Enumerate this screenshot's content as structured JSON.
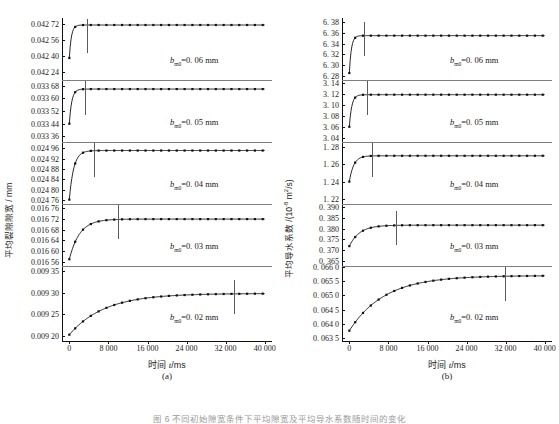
{
  "figure": {
    "caption": "图 6  不同初始隙宽条件下平均隙宽及平均导水系数随时间的变化"
  },
  "panels": [
    {
      "key": "a",
      "label": "(a)",
      "ytitle": "平均裂隙隙宽 / mm",
      "xtitle_cn": "时间 ",
      "xtitle_var": "t",
      "xtitle_unit": "/ms",
      "xticks": [
        "0",
        "8 000",
        "16 000",
        "24 000",
        "32 000",
        "40 000"
      ],
      "xvalues": [
        0,
        8000,
        16000,
        24000,
        32000,
        40000
      ],
      "xlim": [
        -1500,
        41500
      ],
      "subplots": [
        {
          "annotation_var": "b",
          "annotation_sub": "m0",
          "annotation_text": "=0. 06 mm",
          "yticks": [
            "0.042 72",
            "0.042 56",
            "0.042 40",
            "0.042 24"
          ],
          "yvalues": [
            0.04272,
            0.04256,
            0.0424,
            0.04224
          ],
          "ylim": [
            0.042155,
            0.042775
          ],
          "marker_time": 3600,
          "curve_start": 0.042375,
          "curve_end": 0.042705,
          "tau": 420
        },
        {
          "annotation_var": "b",
          "annotation_sub": "m0",
          "annotation_text": "=0. 05 mm",
          "yticks": [
            "0.033 68",
            "0.033 60",
            "0.033 52",
            "0.033 44",
            "0.033 36"
          ],
          "yvalues": [
            0.03368,
            0.0336,
            0.03352,
            0.03344,
            0.03336
          ],
          "ylim": [
            0.033325,
            0.033715
          ],
          "marker_time": 3100,
          "curve_start": 0.03344,
          "curve_end": 0.033658,
          "tau": 500
        },
        {
          "annotation_var": "b",
          "annotation_sub": "m0",
          "annotation_text": "=0. 04 mm",
          "yticks": [
            "0.024 96",
            "0.024 92",
            "0.024 88",
            "0.024 84",
            "0.024 80",
            "0.024 76"
          ],
          "yvalues": [
            0.02496,
            0.02492,
            0.02488,
            0.02484,
            0.0248,
            0.02476
          ],
          "ylim": [
            0.024745,
            0.024985
          ],
          "marker_time": 5100,
          "curve_start": 0.024762,
          "curve_end": 0.024952,
          "tau": 900
        },
        {
          "annotation_var": "b",
          "annotation_sub": "m0",
          "annotation_text": "=0. 03 mm",
          "yticks": [
            "0.016 76",
            "0.016 72",
            "0.016 68",
            "0.016 64",
            "0.016 60",
            "0.016 56"
          ],
          "yvalues": [
            0.01676,
            0.01672,
            0.01668,
            0.01664,
            0.0166,
            0.01656
          ],
          "ylim": [
            0.016545,
            0.016775
          ],
          "marker_time": 10000,
          "curve_start": 0.01657,
          "curve_end": 0.016719,
          "tau": 2100
        },
        {
          "annotation_var": "b",
          "annotation_sub": "m0",
          "annotation_text": "=0. 02 mm",
          "yticks": [
            "0.009 35",
            "0.009 30",
            "0.009 25",
            "0.009 20"
          ],
          "yvalues": [
            0.00935,
            0.0093,
            0.00925,
            0.0092
          ],
          "ylim": [
            0.009185,
            0.009362
          ],
          "marker_time": 33800,
          "curve_start": 0.009202,
          "curve_end": 0.009298,
          "tau": 7200
        }
      ]
    },
    {
      "key": "b",
      "label": "(b)",
      "ytitle_main": "平均导水系数 /(10",
      "ytitle_exp": "-8",
      "ytitle_tail": " m",
      "ytitle_exp2": "2",
      "ytitle_tail2": "/s)",
      "xtitle_cn": "时间 ",
      "xtitle_var": "t",
      "xtitle_unit": "/ms",
      "xticks": [
        "0",
        "8 000",
        "16 000",
        "24 000",
        "32 000",
        "40 000"
      ],
      "xvalues": [
        0,
        8000,
        16000,
        24000,
        32000,
        40000
      ],
      "xlim": [
        -1500,
        41500
      ],
      "subplots": [
        {
          "annotation_var": "b",
          "annotation_sub": "m0",
          "annotation_text": "=0. 06 mm",
          "yticks": [
            "6. 38",
            "6. 36",
            "6. 34",
            "6. 32",
            "6. 30",
            "6. 28"
          ],
          "yvalues": [
            6.38,
            6.36,
            6.34,
            6.32,
            6.3,
            6.28
          ],
          "ylim": [
            6.272,
            6.388
          ],
          "marker_time": 2900,
          "curve_start": 6.285,
          "curve_end": 6.355,
          "tau": 420
        },
        {
          "annotation_var": "b",
          "annotation_sub": "m0",
          "annotation_text": "=0. 05 mm",
          "yticks": [
            "3. 14",
            "3. 12",
            "3. 10",
            "3. 08",
            "3. 06",
            "3. 04"
          ],
          "yvalues": [
            3.14,
            3.12,
            3.1,
            3.08,
            3.06,
            3.04
          ],
          "ylim": [
            3.032,
            3.146
          ],
          "marker_time": 3700,
          "curve_start": 3.06,
          "curve_end": 3.119,
          "tau": 500
        },
        {
          "annotation_var": "b",
          "annotation_sub": "m0",
          "annotation_text": "=0. 04 mm",
          "yticks": [
            "1. 28",
            "1. 26",
            "1. 24",
            "1. 22"
          ],
          "yvalues": [
            1.28,
            1.26,
            1.24,
            1.22
          ],
          "ylim": [
            1.214,
            1.286
          ],
          "marker_time": 4700,
          "curve_start": 1.24,
          "curve_end": 1.27,
          "tau": 900
        },
        {
          "annotation_var": "b",
          "annotation_sub": "m0",
          "annotation_text": "=0. 03 mm",
          "yticks": [
            "0. 390",
            "0. 385",
            "0. 380",
            "0. 375",
            "0. 370",
            "0. 365"
          ],
          "yvalues": [
            0.39,
            0.385,
            0.38,
            0.375,
            0.37,
            0.365
          ],
          "ylim": [
            0.3625,
            0.3915
          ],
          "marker_time": 9500,
          "curve_start": 0.3718,
          "curve_end": 0.3816,
          "tau": 2100
        },
        {
          "annotation_var": "b",
          "annotation_sub": "m0",
          "annotation_text": "=0. 02 mm",
          "yticks": [
            "0. 066 0",
            "0. 065 5",
            "0. 065 0",
            "0. 064 5",
            "0. 064 0",
            "0. 063 5"
          ],
          "yvalues": [
            0.066,
            0.0655,
            0.065,
            0.0645,
            0.064,
            0.0635
          ],
          "ylim": [
            0.06335,
            0.06604
          ],
          "marker_time": 31800,
          "curve_start": 0.06375,
          "curve_end": 0.0657,
          "tau": 7200
        }
      ]
    }
  ],
  "chart_data": {
    "type": "line",
    "xlabel": "时间 t/ms",
    "xlim": [
      0,
      40000
    ],
    "xticks": [
      0,
      8000,
      16000,
      24000,
      32000,
      40000
    ],
    "grid": false,
    "legend": "none",
    "panels": [
      {
        "name": "(a)",
        "ylabel": "平均裂隙隙宽 / mm",
        "series": [
          {
            "name": "b_m0 = 0.06 mm",
            "ylim": [
              0.04224,
              0.04272
            ],
            "x": [
              0,
              1500,
              3000,
              5000,
              8000,
              12000,
              16000,
              20000,
              24000,
              28000,
              32000,
              36000,
              40000
            ],
            "values": [
              0.042375,
              0.042693,
              0.042704,
              0.042705,
              0.042705,
              0.042705,
              0.042705,
              0.042705,
              0.042705,
              0.042705,
              0.042705,
              0.042705,
              0.042705
            ]
          },
          {
            "name": "b_m0 = 0.05 mm",
            "ylim": [
              0.03336,
              0.03368
            ],
            "x": [
              0,
              1500,
              3000,
              5000,
              8000,
              12000,
              16000,
              20000,
              24000,
              28000,
              32000,
              36000,
              40000
            ],
            "values": [
              0.03344,
              0.033646,
              0.033657,
              0.033658,
              0.033658,
              0.033658,
              0.033658,
              0.033658,
              0.033658,
              0.033658,
              0.033658,
              0.033658,
              0.033658
            ]
          },
          {
            "name": "b_m0 = 0.04 mm",
            "ylim": [
              0.02476,
              0.02496
            ],
            "x": [
              0,
              1500,
              3000,
              5000,
              8000,
              12000,
              16000,
              20000,
              24000,
              28000,
              32000,
              36000,
              40000
            ],
            "values": [
              0.024762,
              0.024915,
              0.024946,
              0.024951,
              0.024952,
              0.024952,
              0.024952,
              0.024952,
              0.024952,
              0.024952,
              0.024952,
              0.024952,
              0.024952
            ]
          },
          {
            "name": "b_m0 = 0.03 mm",
            "ylim": [
              0.01656,
              0.01676
            ],
            "x": [
              0,
              1500,
              3000,
              5000,
              8000,
              12000,
              16000,
              20000,
              24000,
              28000,
              32000,
              36000,
              40000
            ],
            "values": [
              0.01657,
              0.016646,
              0.016683,
              0.016704,
              0.016716,
              0.016719,
              0.016719,
              0.016719,
              0.016719,
              0.016719,
              0.016719,
              0.016719,
              0.016719
            ]
          },
          {
            "name": "b_m0 = 0.02 mm",
            "ylim": [
              0.0092,
              0.00935
            ],
            "x": [
              0,
              2000,
              4000,
              8000,
              12000,
              16000,
              20000,
              24000,
              28000,
              32000,
              36000,
              40000
            ],
            "values": [
              0.009202,
              0.009227,
              0.009246,
              0.009271,
              0.009285,
              0.009292,
              0.009295,
              0.009297,
              0.009298,
              0.009298,
              0.009298,
              0.009298
            ]
          }
        ]
      },
      {
        "name": "(b)",
        "ylabel": "平均导水系数 /(10^-8 m^2/s)",
        "series": [
          {
            "name": "b_m0 = 0.06 mm",
            "ylim": [
              6.28,
              6.38
            ],
            "x": [
              0,
              1500,
              3000,
              5000,
              8000,
              12000,
              16000,
              20000,
              24000,
              28000,
              32000,
              36000,
              40000
            ],
            "values": [
              6.285,
              6.353,
              6.355,
              6.355,
              6.355,
              6.355,
              6.355,
              6.355,
              6.355,
              6.355,
              6.355,
              6.355,
              6.355
            ]
          },
          {
            "name": "b_m0 = 0.05 mm",
            "ylim": [
              3.04,
              3.14
            ],
            "x": [
              0,
              1500,
              3000,
              5000,
              8000,
              12000,
              16000,
              20000,
              24000,
              28000,
              32000,
              36000,
              40000
            ],
            "values": [
              3.06,
              3.116,
              3.119,
              3.119,
              3.119,
              3.119,
              3.119,
              3.119,
              3.119,
              3.119,
              3.119,
              3.119,
              3.119
            ]
          },
          {
            "name": "b_m0 = 0.04 mm",
            "ylim": [
              1.22,
              1.28
            ],
            "x": [
              0,
              1500,
              3000,
              5000,
              8000,
              12000,
              16000,
              20000,
              24000,
              28000,
              32000,
              36000,
              40000
            ],
            "values": [
              1.24,
              1.264,
              1.269,
              1.27,
              1.27,
              1.27,
              1.27,
              1.27,
              1.27,
              1.27,
              1.27,
              1.27,
              1.27
            ]
          },
          {
            "name": "b_m0 = 0.03 mm",
            "ylim": [
              0.365,
              0.39
            ],
            "x": [
              0,
              1500,
              3000,
              5000,
              8000,
              12000,
              16000,
              20000,
              24000,
              28000,
              32000,
              36000,
              40000
            ],
            "values": [
              0.3718,
              0.3768,
              0.3792,
              0.3806,
              0.3814,
              0.3816,
              0.3816,
              0.3816,
              0.3816,
              0.3816,
              0.3816,
              0.3816,
              0.3816
            ]
          },
          {
            "name": "b_m0 = 0.02 mm",
            "ylim": [
              0.0635,
              0.066
            ],
            "x": [
              0,
              2000,
              4000,
              8000,
              12000,
              16000,
              20000,
              24000,
              28000,
              32000,
              36000,
              40000
            ],
            "values": [
              0.06375,
              0.06426,
              0.06464,
              0.06515,
              0.06543,
              0.06558,
              0.06565,
              0.06568,
              0.0657,
              0.0657,
              0.0657,
              0.0657
            ]
          }
        ]
      }
    ]
  }
}
